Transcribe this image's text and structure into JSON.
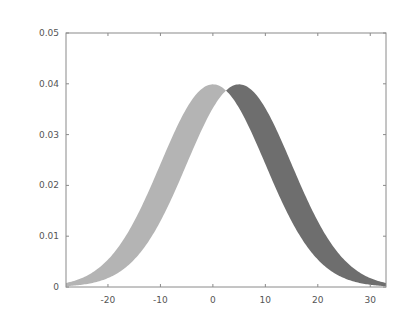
{
  "chart_data": {
    "type": "area",
    "title": "",
    "xlabel": "",
    "ylabel": "",
    "xlim": [
      -28,
      33
    ],
    "ylim": [
      0,
      0.05
    ],
    "grid": false,
    "legend": null,
    "x_ticks": [
      -20,
      -10,
      0,
      10,
      20,
      30
    ],
    "x_tick_labels": [
      "-20",
      "-10",
      "0",
      "10",
      "20",
      "30"
    ],
    "y_ticks": [
      0,
      0.01,
      0.02,
      0.03,
      0.04,
      0.05
    ],
    "y_tick_labels": [
      "0",
      "0.01",
      "0.02",
      "0.03",
      "0.04",
      "0.05"
    ],
    "series": [
      {
        "name": "N(mu=0, sigma=10)",
        "mean": 0,
        "sd": 10,
        "peak": 0.0399,
        "x": [
          -28,
          -20,
          -10,
          0,
          2.5,
          10,
          20,
          30,
          33
        ],
        "values": [
          0.0008,
          0.0054,
          0.0242,
          0.0399,
          0.0387,
          0.0242,
          0.0054,
          0.0004,
          0.0002
        ]
      },
      {
        "name": "N(mu=5, sigma=10)",
        "mean": 5,
        "sd": 10,
        "peak": 0.0399,
        "x": [
          -28,
          -20,
          -10,
          0,
          2.5,
          5,
          10,
          20,
          30,
          33
        ],
        "values": [
          0.0002,
          0.0018,
          0.013,
          0.0352,
          0.0387,
          0.0399,
          0.0352,
          0.013,
          0.0018,
          0.0008
        ]
      }
    ],
    "fills": [
      {
        "name": "left-band",
        "between": [
          "N(mu=0, sigma=10)",
          "N(mu=5, sigma=10)"
        ],
        "x_range": [
          -28,
          2.5
        ],
        "color": "#b4b4b4"
      },
      {
        "name": "right-band",
        "between": [
          "N(mu=5, sigma=10)",
          "N(mu=0, sigma=10)"
        ],
        "x_range": [
          2.5,
          33
        ],
        "color": "#6e6e6e"
      }
    ]
  },
  "layout": {
    "plot_left": 66,
    "plot_right": 386,
    "plot_top": 33,
    "plot_bottom": 287,
    "frame_color": "#8a8a8a"
  }
}
